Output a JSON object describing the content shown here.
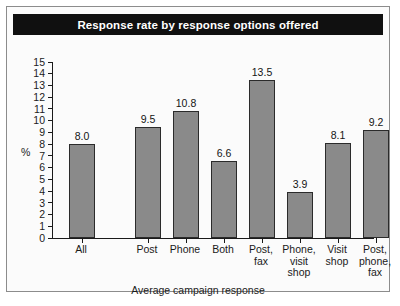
{
  "figure": {
    "title": "Response rate by response options offered",
    "frame_color": "#8c8c8c",
    "title_bg": "#101010",
    "title_fg": "#ffffff"
  },
  "chart_data": {
    "type": "bar",
    "title": "Response rate by response options offered",
    "xlabel": "Average campaign response",
    "ylabel": "%",
    "categories": [
      "All",
      "Post",
      "Phone",
      "Both",
      "Post,\nfax",
      "Phone,\nvisit\nshop",
      "Visit\nshop",
      "Post,\nphone,\nfax"
    ],
    "category_lines": [
      [
        "All"
      ],
      [
        "Post"
      ],
      [
        "Phone"
      ],
      [
        "Both"
      ],
      [
        "Post,",
        "fax"
      ],
      [
        "Phone,",
        "visit",
        "shop"
      ],
      [
        "Visit",
        "shop"
      ],
      [
        "Post,",
        "phone,",
        "fax"
      ]
    ],
    "values": [
      8.0,
      9.5,
      10.8,
      6.6,
      13.5,
      3.9,
      8.1,
      9.2
    ],
    "value_labels": [
      "8.0",
      "9.5",
      "10.8",
      "6.6",
      "13.5",
      "3.9",
      "8.1",
      "9.2"
    ],
    "ylim": [
      0,
      15
    ],
    "yticks": [
      0,
      1,
      2,
      3,
      4,
      5,
      6,
      7,
      8,
      9,
      10,
      11,
      12,
      13,
      14,
      15
    ],
    "ytick_labels": [
      "0",
      "1",
      "2",
      "3",
      "4",
      "5",
      "6",
      "7",
      "8",
      "9",
      "10",
      "11",
      "12",
      "13",
      "14",
      "15"
    ],
    "grid": false,
    "legend": null,
    "bar_fill": "#8a8a8a",
    "bar_edge": "#2b2b2b"
  }
}
